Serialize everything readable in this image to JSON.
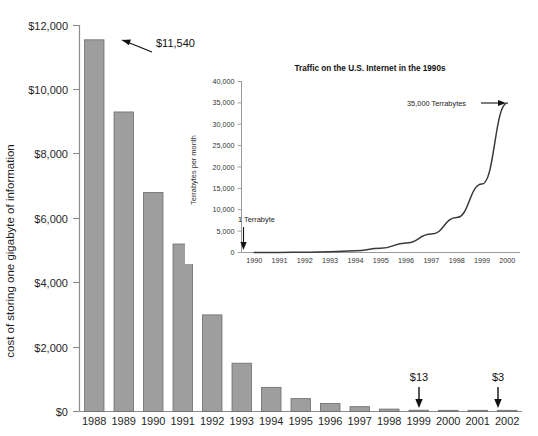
{
  "chart_data": [
    {
      "type": "bar",
      "title": "",
      "xlabel": "",
      "ylabel": "cost of storing one gigabyte of information",
      "categories": [
        "1988",
        "1989",
        "1990",
        "1991",
        "1992",
        "1993",
        "1994",
        "1995",
        "1996",
        "1997",
        "1998",
        "1999",
        "2000",
        "2001",
        "2002"
      ],
      "values": [
        11540,
        9300,
        6800,
        5200,
        3000,
        1500,
        750,
        400,
        250,
        150,
        75,
        40,
        13,
        7,
        3
      ],
      "ylim": [
        0,
        12000
      ],
      "ytick_values": [
        0,
        2000,
        4000,
        6000,
        8000,
        10000,
        12000
      ],
      "ytick_labels": [
        "$0",
        "$2,000",
        "$4,000",
        "$6,000",
        "$8,000",
        "$10,000",
        "$12,000"
      ],
      "grid": false,
      "legend": "none",
      "bar_color": "#9e9e9e",
      "bar_edge_color": "#6b6b6b",
      "axis_color": "#8c8c8c",
      "annotations": [
        {
          "text": "$11,540",
          "category": "1988",
          "value": 11540,
          "style": "diagonal-arrow-left"
        },
        {
          "text": "$13",
          "category": "2000",
          "value": 13,
          "style": "down-arrow"
        },
        {
          "text": "$3",
          "category": "2002",
          "value": 3,
          "style": "down-arrow"
        }
      ]
    },
    {
      "type": "line",
      "title": "Traffic on the U.S. Internet in the 1990s",
      "xlabel": "",
      "ylabel": "Terrabytes per month",
      "x": [
        "1990",
        "1991",
        "1992",
        "1993",
        "1994",
        "1995",
        "1996",
        "1997",
        "1998",
        "1999",
        "2000"
      ],
      "values": [
        1,
        20,
        80,
        200,
        400,
        1000,
        2200,
        4300,
        8200,
        16000,
        35000
      ],
      "ylim": [
        0,
        40000
      ],
      "ytick_values": [
        0,
        5000,
        10000,
        15000,
        20000,
        25000,
        30000,
        35000,
        40000
      ],
      "ytick_labels": [
        "0",
        "5,000",
        "10,000",
        "15,000",
        "20,000",
        "25,000",
        "30,000",
        "35,000",
        "40,000"
      ],
      "grid": false,
      "legend": "none",
      "line_color": "#3a3a3a",
      "axis_color": "#9a9a9a",
      "annotations": [
        {
          "text": "1 Terrabyte",
          "x": "1990",
          "value": 1,
          "style": "down-arrow"
        },
        {
          "text": "35,000 Terrabytes",
          "x": "2000",
          "value": 35000,
          "style": "right-arrow"
        }
      ]
    }
  ],
  "main": {
    "ylabel": "cost of storing one gigabyte of information",
    "ytick_labels": [
      "$12,000",
      "$10,000",
      "$8,000",
      "$6,000",
      "$4,000",
      "$2,000",
      "$0"
    ],
    "xtick_labels": [
      "1988",
      "1989",
      "1990",
      "1991",
      "1992",
      "1993",
      "1994",
      "1995",
      "1996",
      "1997",
      "1998",
      "1999",
      "2000",
      "2001",
      "2002"
    ],
    "annotation_first": "$11,540",
    "annotation_2000": "$13",
    "annotation_2002": "$3"
  },
  "inset": {
    "title": "Traffic on the U.S. Internet in the 1990s",
    "ylabel": "Terrabytes per month",
    "ytick_labels": [
      "40,000",
      "35,000",
      "30,000",
      "25,000",
      "20,000",
      "15,000",
      "10,000",
      "5,000",
      "0"
    ],
    "xtick_labels": [
      "1990",
      "1991",
      "1992",
      "1993",
      "1994",
      "1995",
      "1996",
      "1997",
      "1998",
      "1999",
      "2000"
    ],
    "annotation_start": "1 Terrabyte",
    "annotation_end": "35,000 Terrabytes"
  }
}
